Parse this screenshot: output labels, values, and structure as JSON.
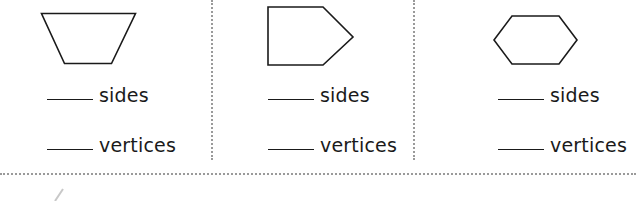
{
  "worksheet": {
    "shapes": [
      {
        "name": "trapezoid",
        "sides_label": "sides",
        "vertices_label": "vertices",
        "sides_answer": "",
        "vertices_answer": ""
      },
      {
        "name": "pentagon",
        "sides_label": "sides",
        "vertices_label": "vertices",
        "sides_answer": "",
        "vertices_answer": ""
      },
      {
        "name": "hexagon",
        "sides_label": "sides",
        "vertices_label": "vertices",
        "sides_answer": "",
        "vertices_answer": ""
      }
    ],
    "colors": {
      "stroke": "#1a1a1a",
      "divider": "#9a9a9a",
      "background": "#ffffff"
    }
  }
}
